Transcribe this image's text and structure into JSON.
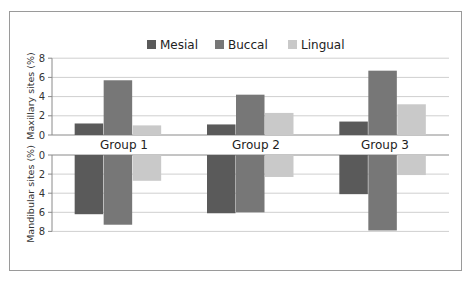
{
  "chart_data": {
    "type": "bar",
    "title": "",
    "categories": [
      "Group 1",
      "Group 2",
      "Group 3"
    ],
    "legend": {
      "placement": "top-center",
      "entries": [
        "Mesial",
        "Buccal",
        "Lingual"
      ]
    },
    "panels": [
      {
        "name": "maxillary",
        "ylabel": "Maxillary sites (%)",
        "ylim": [
          0,
          8
        ],
        "yticks": [
          "0",
          "2",
          "4",
          "6",
          "8"
        ],
        "direction": "up",
        "series": [
          {
            "name": "Mesial",
            "values": [
              1.2,
              1.1,
              1.4
            ]
          },
          {
            "name": "Buccal",
            "values": [
              5.7,
              4.2,
              6.7
            ]
          },
          {
            "name": "Lingual",
            "values": [
              1.0,
              2.3,
              3.2
            ]
          }
        ]
      },
      {
        "name": "mandibular",
        "ylabel": "Mandibular sites (%)",
        "ylim": [
          0,
          8
        ],
        "yticks": [
          "0",
          "2",
          "4",
          "6",
          "8"
        ],
        "direction": "down",
        "series": [
          {
            "name": "Mesial",
            "values": [
              6.2,
              6.1,
              4.1
            ]
          },
          {
            "name": "Buccal",
            "values": [
              7.3,
              6.0,
              7.9
            ]
          },
          {
            "name": "Lingual",
            "values": [
              2.7,
              2.3,
              2.1
            ]
          }
        ]
      }
    ],
    "grid": true,
    "colors": {
      "Mesial": "#5a5a5a",
      "Buccal": "#777777",
      "Lingual": "#c9c9c9",
      "grid": "#cfcfcf",
      "frame": "#9a9a9a"
    }
  }
}
